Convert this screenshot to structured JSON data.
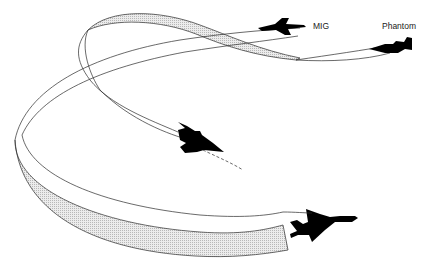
{
  "diagram": {
    "type": "air-combat-maneuver-illustration",
    "labels": {
      "mig": "MIG",
      "phantom": "Phantom"
    },
    "aircraft": [
      {
        "name": "MIG",
        "position": "top-center-right",
        "silhouette": "delta-wing fighter"
      },
      {
        "name": "Phantom",
        "position": "top-right",
        "silhouette": "F-4 fighter"
      },
      {
        "name": "Phantom-maneuvering",
        "position": "center",
        "silhouette": "F-4 fighter banking"
      },
      {
        "name": "MIG-foreground",
        "position": "bottom-right",
        "silhouette": "delta-wing fighter large"
      }
    ],
    "colors": {
      "line": "#2a2a2a",
      "ribbon_fill": "#d8d8d8",
      "aircraft": "#000000",
      "background": "#ffffff"
    }
  }
}
